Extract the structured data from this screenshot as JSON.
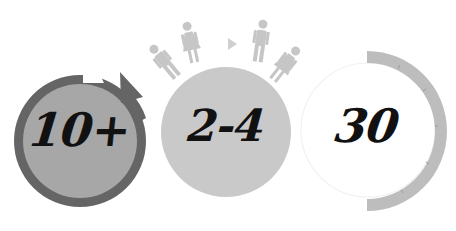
{
  "figure": {
    "items": [
      {
        "id": "group-size-min",
        "value": "10+",
        "icon": "circular-arrow-icon",
        "fill_color": "#a7a7a7",
        "ring_color": "#656565"
      },
      {
        "id": "team-size",
        "value": "2-4",
        "icon": "people-icon",
        "fill_color": "#c9c9c9",
        "figure_color": "#c4c4c4",
        "figures": [
          "man",
          "woman",
          "arrow",
          "man",
          "woman"
        ]
      },
      {
        "id": "duration",
        "value": "30",
        "icon": "timer-arc-icon",
        "fill_color": "#ffffff",
        "arc_color": "#bdbdbd",
        "outline_color": "#f0f0f0"
      }
    ]
  }
}
